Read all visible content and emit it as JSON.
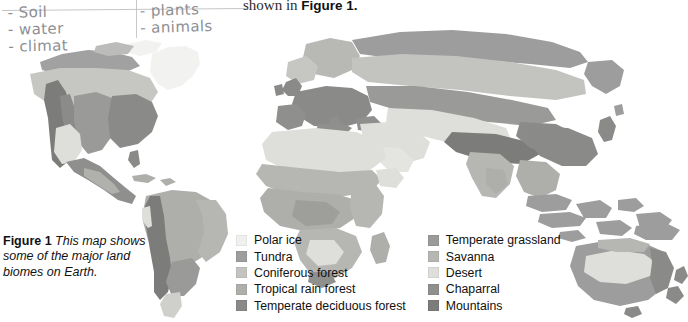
{
  "page": {
    "body_text_prefix": "shown in ",
    "body_text_bold": "Figure 1."
  },
  "handwriting": {
    "left_column": [
      "- Soil",
      "- water",
      "- climat"
    ],
    "right_column": [
      "- plants",
      "- animals"
    ]
  },
  "caption": {
    "lead": "Figure 1",
    "text": "  This map shows some of the major land biomes on Earth."
  },
  "legend": {
    "column_1": [
      {
        "label": "Polar ice",
        "color": "#f0f0ee"
      },
      {
        "label": "Tundra",
        "color": "#9d9d9d"
      },
      {
        "label": "Coniferous forest",
        "color": "#c3c3c0"
      },
      {
        "label": "Tropical rain forest",
        "color": "#aeaeab"
      },
      {
        "label": "Temperate deciduous forest",
        "color": "#8a8a88"
      }
    ],
    "column_2": [
      {
        "label": "Temperate grassland",
        "color": "#9a9a98"
      },
      {
        "label": "Savanna",
        "color": "#b6b6b3"
      },
      {
        "label": "Desert",
        "color": "#dededa"
      },
      {
        "label": "Chaparral",
        "color": "#8f8f8d"
      },
      {
        "label": "Mountains",
        "color": "#7c7c7a"
      }
    ]
  },
  "map": {
    "title": "World land biomes map",
    "background": "#ffffff",
    "biome_colors": {
      "polar_ice": "#f0f0ee",
      "tundra": "#9d9d9d",
      "coniferous_forest": "#c3c3c0",
      "tropical_rain_forest": "#aeaeab",
      "temperate_deciduous_forest": "#8a8a88",
      "temperate_grassland": "#9a9a98",
      "savanna": "#b6b6b3",
      "desert": "#dededa",
      "chaparral": "#8f8f8d",
      "mountains": "#7c7c7a"
    },
    "regions": [
      "North America",
      "South America",
      "Greenland",
      "Europe",
      "Africa",
      "Asia",
      "Australia",
      "New Zealand",
      "Indonesia"
    ]
  }
}
